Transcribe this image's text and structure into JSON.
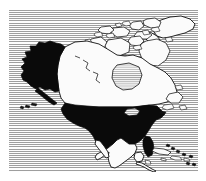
{
  "figure": {
    "kind": "map",
    "width": 206,
    "height": 181,
    "style": "halftone-scanline bitmap"
  },
  "colors": {
    "page_background": "#ffffff",
    "ocean_stripe_dark": "#9e9e9e",
    "ocean_stripe_light": "#fdfdfd",
    "land_fill_light": "#fbfbfb",
    "land_fill_dark": "#0a0a0a",
    "outline": "#111111"
  },
  "panel": {
    "left": 9,
    "top": 10,
    "width": 189,
    "height": 162
  },
  "regions": [
    {
      "id": "alaska",
      "name": "Alaska",
      "shading": "dark"
    },
    {
      "id": "contiguous-usa",
      "name": "Contiguous United States",
      "shading": "dark"
    },
    {
      "id": "canada",
      "name": "Canada",
      "shading": "light"
    },
    {
      "id": "greenland",
      "name": "Greenland",
      "shading": "light"
    },
    {
      "id": "mexico",
      "name": "Mexico",
      "shading": "light"
    },
    {
      "id": "central-america",
      "name": "Central America",
      "shading": "light"
    },
    {
      "id": "arctic-archipelago",
      "name": "Canadian Arctic Archipelago",
      "shading": "light"
    },
    {
      "id": "newfoundland",
      "name": "Newfoundland",
      "shading": "light"
    },
    {
      "id": "baffin-island",
      "name": "Baffin Island",
      "shading": "light"
    },
    {
      "id": "victoria-island",
      "name": "Victoria Island",
      "shading": "light"
    },
    {
      "id": "banks-island",
      "name": "Banks Island",
      "shading": "light"
    },
    {
      "id": "ellesmere-island",
      "name": "Ellesmere Island",
      "shading": "light"
    },
    {
      "id": "cuba",
      "name": "Cuba",
      "shading": "light"
    },
    {
      "id": "hispaniola",
      "name": "Hispaniola",
      "shading": "light"
    },
    {
      "id": "aleutian-islands",
      "name": "Aleutian Islands",
      "shading": "dark"
    },
    {
      "id": "hudson-bay",
      "name": "Hudson Bay",
      "shading": "water"
    },
    {
      "id": "great-lakes",
      "name": "Great Lakes",
      "shading": "water"
    }
  ],
  "legend": {
    "highlighted_label": "United States (incl. Alaska)",
    "highlighted_shading": "solid black",
    "other_label": "Other countries",
    "other_shading": "white with outline",
    "ocean_label": "Ocean",
    "ocean_shading": "horizontal scanlines"
  }
}
